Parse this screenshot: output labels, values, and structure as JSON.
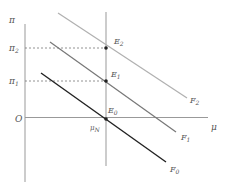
{
  "diagram": {
    "y_axis_label": "π",
    "x_axis_label": "μ",
    "origin_label": "O",
    "mu_n_label": "μ",
    "mu_n_sub": "N",
    "y_ticks": [
      {
        "base": "π",
        "sub": "2"
      },
      {
        "base": "π",
        "sub": "1"
      }
    ],
    "points": [
      {
        "base": "E",
        "sub": "2"
      },
      {
        "base": "E",
        "sub": "1"
      },
      {
        "base": "E",
        "sub": "0"
      }
    ],
    "curves": [
      {
        "base": "F",
        "sub": "2",
        "color": "#b0b0b0"
      },
      {
        "base": "F",
        "sub": "1",
        "color": "#777777"
      },
      {
        "base": "F",
        "sub": "0",
        "color": "#222222"
      }
    ]
  }
}
